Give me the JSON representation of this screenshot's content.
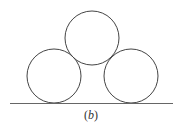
{
  "figure": {
    "caption": "(b)",
    "caption_letter": "b",
    "circles": [
      {
        "id": "left",
        "cx": 54,
        "cy": 76,
        "r": 27
      },
      {
        "id": "right",
        "cx": 131,
        "cy": 76,
        "r": 27
      },
      {
        "id": "top",
        "cx": 92,
        "cy": 38,
        "r": 27
      }
    ],
    "ground": {
      "x1": 10,
      "x2": 173,
      "y": 103
    },
    "stroke_color": "#444444"
  }
}
